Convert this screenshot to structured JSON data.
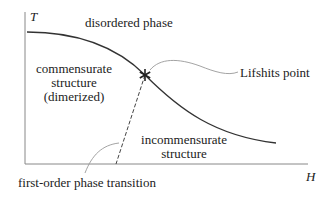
{
  "diagram": {
    "type": "phase_diagram",
    "axes": {
      "y_label": "T",
      "x_label": "H"
    },
    "regions": {
      "top": "disordered phase",
      "left_line1": "commensurate",
      "left_line2": "structure",
      "left_line3": "(dimerized)",
      "right_line1": "incommensurate",
      "right_line2": "structure"
    },
    "annotations": {
      "lifshits_point": "Lifshits point",
      "first_order": "first-order phase transition"
    },
    "marker": "asterisk",
    "colors": {
      "line": "#333333",
      "axis": "#888888",
      "leader": "#999999"
    }
  }
}
